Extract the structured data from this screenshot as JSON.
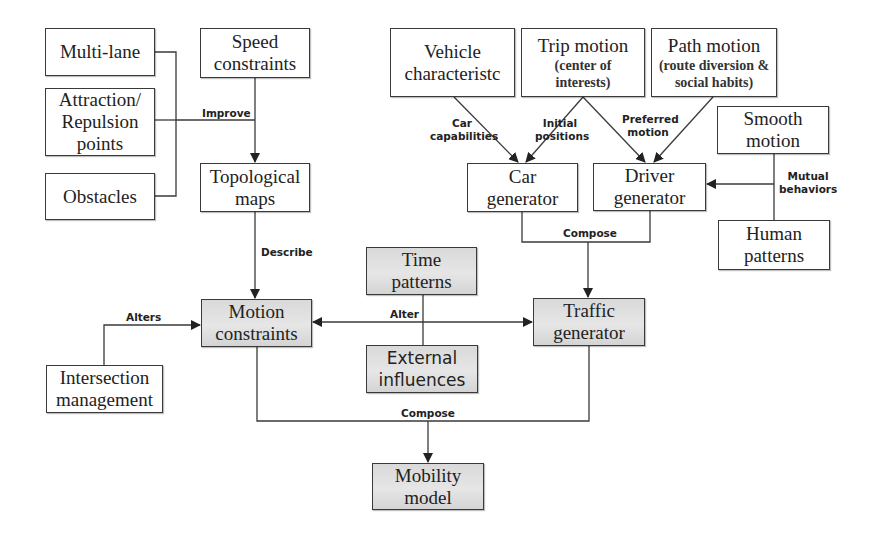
{
  "diagram": {
    "type": "flowchart",
    "nodes": {
      "multi_lane": {
        "line1": "Multi-lane"
      },
      "attraction": {
        "line1": "Attraction/",
        "line2": "Repulsion",
        "line3": "points"
      },
      "obstacles": {
        "line1": "Obstacles"
      },
      "speed_constraints": {
        "line1": "Speed",
        "line2": "constraints"
      },
      "topological_maps": {
        "line1": "Topological",
        "line2": "maps"
      },
      "vehicle": {
        "line1": "Vehicle",
        "line2": "characteristc"
      },
      "trip_motion": {
        "line1": "Trip motion",
        "sub1": "(center of",
        "sub2": "interests)"
      },
      "path_motion": {
        "line1": "Path motion",
        "sub1": "(route diversion &",
        "sub2": "social habits)"
      },
      "smooth_motion": {
        "line1": "Smooth",
        "line2": "motion"
      },
      "human_patterns": {
        "line1": "Human",
        "line2": "patterns"
      },
      "car_generator": {
        "line1": "Car",
        "line2": "generator"
      },
      "driver_generator": {
        "line1": "Driver",
        "line2": "generator"
      },
      "time_patterns": {
        "line1": "Time",
        "line2": "patterns"
      },
      "external_influences": {
        "line1": "External",
        "line2": "influences"
      },
      "motion_constraints": {
        "line1": "Motion",
        "line2": "constraints"
      },
      "traffic_generator": {
        "line1": "Traffic",
        "line2": "generator"
      },
      "intersection_management": {
        "line1": "Intersection",
        "line2": "management"
      },
      "mobility_model": {
        "line1": "Mobility",
        "line2": "model"
      }
    },
    "edge_labels": {
      "improve": "Improve",
      "describe": "Describe",
      "car_capabilities_1": "Car",
      "car_capabilities_2": "capabilities",
      "initial_positions_1": "Initial",
      "initial_positions_2": "positions",
      "preferred_motion_1": "Preferred",
      "preferred_motion_2": "motion",
      "mutual_behaviors_1": "Mutual",
      "mutual_behaviors_2": "behaviors",
      "compose_generators": "Compose",
      "alter": "Alter",
      "alters": "Alters",
      "compose_model": "Compose"
    },
    "edges": [
      {
        "from": [
          "Multi-lane",
          "Attraction/Repulsion points",
          "Obstacles"
        ],
        "to": "Topological maps",
        "label": "Improve"
      },
      {
        "from": "Speed constraints",
        "to": "Topological maps"
      },
      {
        "from": "Topological maps",
        "to": "Motion constraints",
        "label": "Describe"
      },
      {
        "from": "Vehicle characteristc",
        "to": "Car generator",
        "label": "Car capabilities"
      },
      {
        "from": "Trip motion",
        "to": "Car generator",
        "label": "Initial positions"
      },
      {
        "from": "Trip motion",
        "to": "Driver generator",
        "label": "Preferred motion"
      },
      {
        "from": "Path motion",
        "to": "Driver generator"
      },
      {
        "from": [
          "Smooth motion",
          "Human patterns"
        ],
        "to": "Driver generator",
        "label": "Mutual behaviors"
      },
      {
        "from": [
          "Car generator",
          "Driver generator"
        ],
        "to": "Traffic generator",
        "label": "Compose"
      },
      {
        "from": [
          "Time patterns",
          "External influences"
        ],
        "to": [
          "Motion constraints",
          "Traffic generator"
        ],
        "label": "Alter"
      },
      {
        "from": "Intersection management",
        "to": "Motion constraints",
        "label": "Alters"
      },
      {
        "from": [
          "Motion constraints",
          "Traffic generator"
        ],
        "to": "Mobility model",
        "label": "Compose"
      }
    ],
    "colors": {
      "stroke": "#3a3a3a",
      "box_fill": "#ffffff",
      "shaded_fill": "#dcdcdc"
    }
  }
}
